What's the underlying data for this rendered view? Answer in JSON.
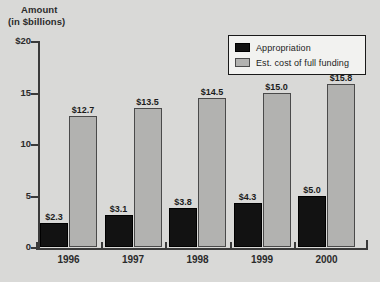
{
  "chart_data": {
    "type": "bar",
    "title": "Amount (in $billions)",
    "title_line1": "Amount",
    "title_line2": "(in $billions)",
    "xlabel": "",
    "ylabel": "Amount (in $billions)",
    "ylim": [
      0,
      20
    ],
    "grid": false,
    "legend_position": "top-right",
    "categories": [
      "1996",
      "1997",
      "1998",
      "1999",
      "2000"
    ],
    "y_ticks": [
      {
        "value": 0,
        "label": "0"
      },
      {
        "value": 5,
        "label": "5"
      },
      {
        "value": 10,
        "label": "10"
      },
      {
        "value": 15,
        "label": "15"
      },
      {
        "value": 20,
        "label": "$20"
      }
    ],
    "series": [
      {
        "name": "Appropriation",
        "color": "#121212",
        "values": [
          2.3,
          3.1,
          3.8,
          4.3,
          5.0
        ],
        "labels": [
          "$2.3",
          "$3.1",
          "$3.8",
          "$4.3",
          "$5.0"
        ]
      },
      {
        "name": "Est. cost of full funding",
        "color": "#b2b2b0",
        "values": [
          12.7,
          13.5,
          14.5,
          15.0,
          15.8
        ],
        "labels": [
          "$12.7",
          "$13.5",
          "$14.5",
          "$15.0",
          "$15.8"
        ]
      }
    ]
  },
  "legend": {
    "items": [
      {
        "label": "Appropriation",
        "swatch": "appropriation"
      },
      {
        "label": "Est. cost of full funding",
        "swatch": "fullfunding"
      }
    ]
  }
}
